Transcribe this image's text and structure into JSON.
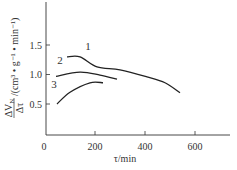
{
  "chart_data": {
    "type": "line",
    "title": "",
    "xlabel": "τ/min",
    "ylabel": "ΔV_N/Δτ /(cm³·g⁻¹·min⁻¹)",
    "ylabel_parts": {
      "frac_num": "ΔV",
      "frac_num_sub": "N",
      "frac_den": "Δτ",
      "units": "/(cm³ • g⁻¹ • min⁻¹)"
    },
    "xlim": [
      0,
      740
    ],
    "ylim": [
      0,
      2.25
    ],
    "x_ticks": [
      0,
      200,
      400,
      600
    ],
    "x_tick_labels": [
      "0",
      "200",
      "400",
      "600"
    ],
    "y_ticks": [
      0.5,
      1.0,
      1.5
    ],
    "y_tick_labels": [
      "0.5",
      "1.0",
      "1.5"
    ],
    "grid": false,
    "legend": "inline curve labels",
    "series": [
      {
        "name": "1",
        "x": [
          88,
          140,
          208,
          300,
          408,
          480,
          540
        ],
        "y": [
          1.3,
          1.3,
          1.13,
          1.08,
          0.96,
          0.86,
          0.69
        ]
      },
      {
        "name": "2",
        "x": [
          44,
          140,
          220,
          288
        ],
        "y": [
          0.97,
          1.04,
          0.99,
          0.92
        ]
      },
      {
        "name": "3",
        "x": [
          48,
          100,
          180,
          232
        ],
        "y": [
          0.5,
          0.7,
          0.86,
          0.86
        ]
      }
    ],
    "curve_labels": [
      {
        "text": "1",
        "x": 88,
        "y": 50
      },
      {
        "text": "2",
        "x": 60,
        "y": 64
      },
      {
        "text": "3",
        "x": 54,
        "y": 88
      }
    ]
  }
}
